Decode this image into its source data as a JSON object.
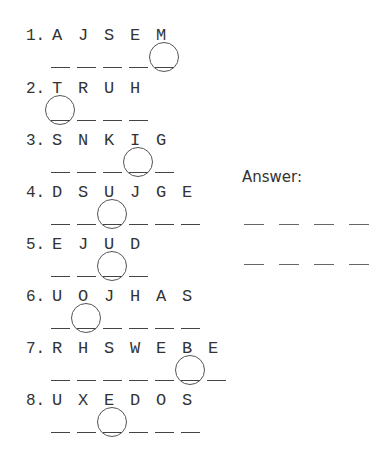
{
  "puzzles": [
    {
      "number": "1.",
      "letters": [
        "A",
        "J",
        "S",
        "E",
        "M"
      ],
      "blank_count": 5,
      "circled_index": 4
    },
    {
      "number": "2.",
      "letters": [
        "T",
        "R",
        "U",
        "H"
      ],
      "blank_count": 4,
      "circled_index": 0
    },
    {
      "number": "3.",
      "letters": [
        "S",
        "N",
        "K",
        "I",
        "G"
      ],
      "blank_count": 5,
      "circled_index": 3
    },
    {
      "number": "4.",
      "letters": [
        "D",
        "S",
        "U",
        "J",
        "G",
        "E"
      ],
      "blank_count": 6,
      "circled_index": 2
    },
    {
      "number": "5.",
      "letters": [
        "E",
        "J",
        "U",
        "D"
      ],
      "blank_count": 4,
      "circled_index": 2
    },
    {
      "number": "6.",
      "letters": [
        "U",
        "O",
        "J",
        "H",
        "A",
        "S"
      ],
      "blank_count": 6,
      "circled_index": 1
    },
    {
      "number": "7.",
      "letters": [
        "R",
        "H",
        "S",
        "W",
        "E",
        "B",
        "E"
      ],
      "blank_count": 7,
      "circled_index": 5
    },
    {
      "number": "8.",
      "letters": [
        "U",
        "X",
        "E",
        "D",
        "O",
        "S"
      ],
      "blank_count": 6,
      "circled_index": 2
    }
  ],
  "answer": {
    "label": "Answer:",
    "rows": [
      4,
      4
    ]
  }
}
